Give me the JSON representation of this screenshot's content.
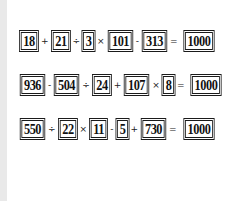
{
  "puzzle": {
    "rows": [
      {
        "tokens": [
          "18",
          "+",
          "21",
          "÷",
          "3",
          "×",
          "101",
          "-",
          "313",
          "=",
          "1000"
        ]
      },
      {
        "tokens": [
          "936",
          "-",
          "504",
          "÷",
          "24",
          "+",
          "107",
          "×",
          "8",
          "=",
          "1000"
        ]
      },
      {
        "tokens": [
          "550",
          "÷",
          "22",
          "×",
          "11",
          "-",
          "5",
          "+",
          "730",
          "=",
          "1000"
        ]
      }
    ]
  },
  "colors": {
    "background": "#ffffff",
    "strip": "#e9e9e9",
    "ink": "#111111"
  }
}
